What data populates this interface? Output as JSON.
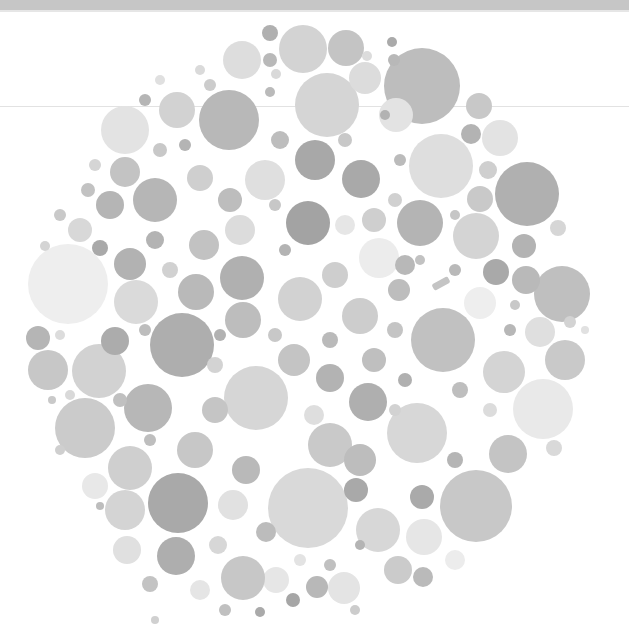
{
  "image": {
    "description": "Grayscale color-vision test plate made of packed dots",
    "width": 629,
    "height": 634
  },
  "colors": {
    "background": "#ffffff",
    "top_bar": "#c6c6c6",
    "fold_line": "#e2e2e2"
  },
  "dots": [
    {
      "cx": 422,
      "cy": 86,
      "r": 38,
      "fill": "#bdbdbd"
    },
    {
      "cx": 327,
      "cy": 105,
      "r": 32,
      "fill": "#d5d5d5"
    },
    {
      "cx": 229,
      "cy": 120,
      "r": 30,
      "fill": "#b8b8b8"
    },
    {
      "cx": 125,
      "cy": 130,
      "r": 24,
      "fill": "#e3e3e3"
    },
    {
      "cx": 303,
      "cy": 49,
      "r": 24,
      "fill": "#d3d3d3"
    },
    {
      "cx": 242,
      "cy": 60,
      "r": 19,
      "fill": "#dddddd"
    },
    {
      "cx": 346,
      "cy": 48,
      "r": 18,
      "fill": "#c4c4c4"
    },
    {
      "cx": 365,
      "cy": 78,
      "r": 16,
      "fill": "#dcdcdc"
    },
    {
      "cx": 177,
      "cy": 110,
      "r": 18,
      "fill": "#d2d2d2"
    },
    {
      "cx": 270,
      "cy": 33,
      "r": 8,
      "fill": "#b0b0b0"
    },
    {
      "cx": 270,
      "cy": 60,
      "r": 7,
      "fill": "#b9b9b9"
    },
    {
      "cx": 392,
      "cy": 42,
      "r": 5,
      "fill": "#aaaaaa"
    },
    {
      "cx": 394,
      "cy": 60,
      "r": 6,
      "fill": "#b8b8b8"
    },
    {
      "cx": 479,
      "cy": 106,
      "r": 13,
      "fill": "#c8c8c8"
    },
    {
      "cx": 441,
      "cy": 166,
      "r": 32,
      "fill": "#dedede"
    },
    {
      "cx": 527,
      "cy": 194,
      "r": 32,
      "fill": "#b0b0b0"
    },
    {
      "cx": 471,
      "cy": 134,
      "r": 10,
      "fill": "#b3b3b3"
    },
    {
      "cx": 500,
      "cy": 138,
      "r": 18,
      "fill": "#e3e3e3"
    },
    {
      "cx": 488,
      "cy": 170,
      "r": 9,
      "fill": "#cfcfcf"
    },
    {
      "cx": 480,
      "cy": 199,
      "r": 13,
      "fill": "#c9c9c9"
    },
    {
      "cx": 476,
      "cy": 236,
      "r": 23,
      "fill": "#d4d4d4"
    },
    {
      "cx": 420,
      "cy": 223,
      "r": 23,
      "fill": "#b4b4b4"
    },
    {
      "cx": 524,
      "cy": 246,
      "r": 12,
      "fill": "#b3b3b3"
    },
    {
      "cx": 558,
      "cy": 228,
      "r": 8,
      "fill": "#d6d6d6"
    },
    {
      "cx": 562,
      "cy": 294,
      "r": 28,
      "fill": "#bfbfbf"
    },
    {
      "cx": 526,
      "cy": 280,
      "r": 14,
      "fill": "#b9b9b9"
    },
    {
      "cx": 496,
      "cy": 272,
      "r": 13,
      "fill": "#a9a9a9"
    },
    {
      "cx": 480,
      "cy": 303,
      "r": 16,
      "fill": "#eeeeee"
    },
    {
      "cx": 540,
      "cy": 332,
      "r": 15,
      "fill": "#dfdfdf"
    },
    {
      "cx": 565,
      "cy": 360,
      "r": 20,
      "fill": "#c9c9c9"
    },
    {
      "cx": 504,
      "cy": 372,
      "r": 21,
      "fill": "#d4d4d4"
    },
    {
      "cx": 443,
      "cy": 340,
      "r": 32,
      "fill": "#c1c1c1"
    },
    {
      "cx": 379,
      "cy": 258,
      "r": 20,
      "fill": "#ececec"
    },
    {
      "cx": 399,
      "cy": 290,
      "r": 11,
      "fill": "#bdbdbd"
    },
    {
      "cx": 543,
      "cy": 409,
      "r": 30,
      "fill": "#e9e9e9"
    },
    {
      "cx": 508,
      "cy": 454,
      "r": 19,
      "fill": "#c4c4c4"
    },
    {
      "cx": 554,
      "cy": 448,
      "r": 8,
      "fill": "#d9d9d9"
    },
    {
      "cx": 476,
      "cy": 506,
      "r": 36,
      "fill": "#c8c8c8"
    },
    {
      "cx": 417,
      "cy": 433,
      "r": 30,
      "fill": "#d7d7d7"
    },
    {
      "cx": 368,
      "cy": 402,
      "r": 19,
      "fill": "#afafaf"
    },
    {
      "cx": 422,
      "cy": 497,
      "r": 12,
      "fill": "#aaaaaa"
    },
    {
      "cx": 424,
      "cy": 537,
      "r": 18,
      "fill": "#e6e6e6"
    },
    {
      "cx": 378,
      "cy": 530,
      "r": 22,
      "fill": "#d7d7d7"
    },
    {
      "cx": 398,
      "cy": 570,
      "r": 14,
      "fill": "#cbcbcb"
    },
    {
      "cx": 455,
      "cy": 560,
      "r": 10,
      "fill": "#ececec"
    },
    {
      "cx": 423,
      "cy": 577,
      "r": 10,
      "fill": "#bababa"
    },
    {
      "cx": 308,
      "cy": 508,
      "r": 40,
      "fill": "#d9d9d9"
    },
    {
      "cx": 344,
      "cy": 588,
      "r": 16,
      "fill": "#e4e4e4"
    },
    {
      "cx": 317,
      "cy": 587,
      "r": 11,
      "fill": "#b8b8b8"
    },
    {
      "cx": 276,
      "cy": 580,
      "r": 13,
      "fill": "#e6e6e6"
    },
    {
      "cx": 293,
      "cy": 600,
      "r": 7,
      "fill": "#a6a6a6"
    },
    {
      "cx": 243,
      "cy": 578,
      "r": 22,
      "fill": "#c7c7c7"
    },
    {
      "cx": 178,
      "cy": 503,
      "r": 30,
      "fill": "#a9a9a9"
    },
    {
      "cx": 176,
      "cy": 556,
      "r": 19,
      "fill": "#aeaeae"
    },
    {
      "cx": 125,
      "cy": 510,
      "r": 20,
      "fill": "#d4d4d4"
    },
    {
      "cx": 127,
      "cy": 550,
      "r": 14,
      "fill": "#e0e0e0"
    },
    {
      "cx": 85,
      "cy": 428,
      "r": 30,
      "fill": "#cbcbcb"
    },
    {
      "cx": 130,
      "cy": 468,
      "r": 22,
      "fill": "#cfcfcf"
    },
    {
      "cx": 95,
      "cy": 486,
      "r": 13,
      "fill": "#e8e8e8"
    },
    {
      "cx": 100,
      "cy": 506,
      "r": 4,
      "fill": "#bdbdbd"
    },
    {
      "cx": 148,
      "cy": 408,
      "r": 24,
      "fill": "#b7b7b7"
    },
    {
      "cx": 48,
      "cy": 370,
      "r": 20,
      "fill": "#c7c7c7"
    },
    {
      "cx": 52,
      "cy": 400,
      "r": 4,
      "fill": "#c9c9c9"
    },
    {
      "cx": 99,
      "cy": 371,
      "r": 27,
      "fill": "#d2d2d2"
    },
    {
      "cx": 38,
      "cy": 338,
      "r": 12,
      "fill": "#b5b5b5"
    },
    {
      "cx": 68,
      "cy": 284,
      "r": 40,
      "fill": "#eeeeee"
    },
    {
      "cx": 136,
      "cy": 302,
      "r": 22,
      "fill": "#dadada"
    },
    {
      "cx": 115,
      "cy": 341,
      "r": 14,
      "fill": "#acacac"
    },
    {
      "cx": 182,
      "cy": 345,
      "r": 32,
      "fill": "#aeaeae"
    },
    {
      "cx": 130,
      "cy": 264,
      "r": 16,
      "fill": "#b2b2b2"
    },
    {
      "cx": 196,
      "cy": 292,
      "r": 18,
      "fill": "#b9b9b9"
    },
    {
      "cx": 155,
      "cy": 200,
      "r": 22,
      "fill": "#b6b6b6"
    },
    {
      "cx": 110,
      "cy": 205,
      "r": 14,
      "fill": "#b5b5b5"
    },
    {
      "cx": 80,
      "cy": 230,
      "r": 12,
      "fill": "#d8d8d8"
    },
    {
      "cx": 125,
      "cy": 172,
      "r": 15,
      "fill": "#c3c3c3"
    },
    {
      "cx": 204,
      "cy": 245,
      "r": 15,
      "fill": "#c2c2c2"
    },
    {
      "cx": 242,
      "cy": 278,
      "r": 22,
      "fill": "#b0b0b0"
    },
    {
      "cx": 240,
      "cy": 230,
      "r": 15,
      "fill": "#dcdcdc"
    },
    {
      "cx": 230,
      "cy": 200,
      "r": 12,
      "fill": "#bdbdbd"
    },
    {
      "cx": 200,
      "cy": 178,
      "r": 13,
      "fill": "#cfcfcf"
    },
    {
      "cx": 265,
      "cy": 180,
      "r": 20,
      "fill": "#dfdfdf"
    },
    {
      "cx": 308,
      "cy": 223,
      "r": 22,
      "fill": "#a3a3a3"
    },
    {
      "cx": 315,
      "cy": 160,
      "r": 20,
      "fill": "#a8a8a8"
    },
    {
      "cx": 361,
      "cy": 179,
      "r": 19,
      "fill": "#a9a9a9"
    },
    {
      "cx": 396,
      "cy": 115,
      "r": 17,
      "fill": "#e3e3e3"
    },
    {
      "cx": 345,
      "cy": 225,
      "r": 10,
      "fill": "#e6e6e6"
    },
    {
      "cx": 374,
      "cy": 220,
      "r": 12,
      "fill": "#cfcfcf"
    },
    {
      "cx": 300,
      "cy": 299,
      "r": 22,
      "fill": "#d2d2d2"
    },
    {
      "cx": 360,
      "cy": 316,
      "r": 18,
      "fill": "#cdcdcd"
    },
    {
      "cx": 335,
      "cy": 275,
      "r": 13,
      "fill": "#cecece"
    },
    {
      "cx": 405,
      "cy": 265,
      "r": 10,
      "fill": "#b8b8b8"
    },
    {
      "cx": 256,
      "cy": 398,
      "r": 32,
      "fill": "#d6d6d6"
    },
    {
      "cx": 243,
      "cy": 320,
      "r": 18,
      "fill": "#bdbdbd"
    },
    {
      "cx": 215,
      "cy": 410,
      "r": 13,
      "fill": "#c5c5c5"
    },
    {
      "cx": 195,
      "cy": 450,
      "r": 18,
      "fill": "#c7c7c7"
    },
    {
      "cx": 246,
      "cy": 470,
      "r": 14,
      "fill": "#b9b9b9"
    },
    {
      "cx": 330,
      "cy": 445,
      "r": 22,
      "fill": "#c9c9c9"
    },
    {
      "cx": 360,
      "cy": 460,
      "r": 16,
      "fill": "#bdbdbd"
    },
    {
      "cx": 330,
      "cy": 378,
      "r": 14,
      "fill": "#b3b3b3"
    },
    {
      "cx": 294,
      "cy": 360,
      "r": 16,
      "fill": "#c4c4c4"
    },
    {
      "cx": 374,
      "cy": 360,
      "r": 12,
      "fill": "#bfbfbf"
    },
    {
      "cx": 314,
      "cy": 415,
      "r": 10,
      "fill": "#dedede"
    },
    {
      "cx": 233,
      "cy": 505,
      "r": 15,
      "fill": "#e1e1e1"
    },
    {
      "cx": 266,
      "cy": 532,
      "r": 10,
      "fill": "#bcbcbc"
    },
    {
      "cx": 356,
      "cy": 490,
      "r": 12,
      "fill": "#a9a9a9"
    },
    {
      "cx": 218,
      "cy": 545,
      "r": 9,
      "fill": "#d7d7d7"
    },
    {
      "cx": 150,
      "cy": 584,
      "r": 8,
      "fill": "#c3c3c3"
    },
    {
      "cx": 200,
      "cy": 590,
      "r": 10,
      "fill": "#e5e5e5"
    },
    {
      "cx": 225,
      "cy": 610,
      "r": 6,
      "fill": "#c0c0c0"
    },
    {
      "cx": 260,
      "cy": 612,
      "r": 5,
      "fill": "#aaaaaa"
    },
    {
      "cx": 160,
      "cy": 150,
      "r": 7,
      "fill": "#c8c8c8"
    },
    {
      "cx": 185,
      "cy": 145,
      "r": 6,
      "fill": "#b4b4b4"
    },
    {
      "cx": 95,
      "cy": 165,
      "r": 6,
      "fill": "#d5d5d5"
    },
    {
      "cx": 88,
      "cy": 190,
      "r": 7,
      "fill": "#c2c2c2"
    },
    {
      "cx": 60,
      "cy": 215,
      "r": 6,
      "fill": "#c9c9c9"
    },
    {
      "cx": 45,
      "cy": 246,
      "r": 5,
      "fill": "#d4d4d4"
    },
    {
      "cx": 100,
      "cy": 248,
      "r": 8,
      "fill": "#a9a9a9"
    },
    {
      "cx": 155,
      "cy": 240,
      "r": 9,
      "fill": "#b3b3b3"
    },
    {
      "cx": 170,
      "cy": 270,
      "r": 8,
      "fill": "#d1d1d1"
    },
    {
      "cx": 145,
      "cy": 330,
      "r": 6,
      "fill": "#bdbdbd"
    },
    {
      "cx": 60,
      "cy": 335,
      "r": 5,
      "fill": "#dcdcdc"
    },
    {
      "cx": 70,
      "cy": 395,
      "r": 5,
      "fill": "#d9d9d9"
    },
    {
      "cx": 120,
      "cy": 400,
      "r": 7,
      "fill": "#c0c0c0"
    },
    {
      "cx": 215,
      "cy": 365,
      "r": 8,
      "fill": "#d3d3d3"
    },
    {
      "cx": 220,
      "cy": 335,
      "r": 6,
      "fill": "#b2b2b2"
    },
    {
      "cx": 275,
      "cy": 335,
      "r": 7,
      "fill": "#c8c8c8"
    },
    {
      "cx": 330,
      "cy": 340,
      "r": 8,
      "fill": "#bababa"
    },
    {
      "cx": 395,
      "cy": 330,
      "r": 8,
      "fill": "#c4c4c4"
    },
    {
      "cx": 405,
      "cy": 380,
      "r": 7,
      "fill": "#b0b0b0"
    },
    {
      "cx": 395,
      "cy": 410,
      "r": 6,
      "fill": "#d2d2d2"
    },
    {
      "cx": 460,
      "cy": 390,
      "r": 8,
      "fill": "#bebebe"
    },
    {
      "cx": 490,
      "cy": 410,
      "r": 7,
      "fill": "#dcdcdc"
    },
    {
      "cx": 455,
      "cy": 460,
      "r": 8,
      "fill": "#b5b5b5"
    },
    {
      "cx": 510,
      "cy": 330,
      "r": 6,
      "fill": "#b7b7b7"
    },
    {
      "cx": 515,
      "cy": 305,
      "r": 5,
      "fill": "#c8c8c8"
    },
    {
      "cx": 455,
      "cy": 270,
      "r": 6,
      "fill": "#b9b9b9"
    },
    {
      "cx": 420,
      "cy": 260,
      "r": 5,
      "fill": "#c2c2c2"
    },
    {
      "cx": 455,
      "cy": 215,
      "r": 5,
      "fill": "#c6c6c6"
    },
    {
      "cx": 400,
      "cy": 160,
      "r": 6,
      "fill": "#bbbbbb"
    },
    {
      "cx": 395,
      "cy": 200,
      "r": 7,
      "fill": "#d0d0d0"
    },
    {
      "cx": 345,
      "cy": 140,
      "r": 7,
      "fill": "#c8c8c8"
    },
    {
      "cx": 280,
      "cy": 140,
      "r": 9,
      "fill": "#bdbdbd"
    },
    {
      "cx": 270,
      "cy": 92,
      "r": 5,
      "fill": "#bababa"
    },
    {
      "cx": 210,
      "cy": 85,
      "r": 6,
      "fill": "#cccccc"
    },
    {
      "cx": 200,
      "cy": 70,
      "r": 5,
      "fill": "#dadada"
    },
    {
      "cx": 160,
      "cy": 80,
      "r": 5,
      "fill": "#e0e0e0"
    },
    {
      "cx": 145,
      "cy": 100,
      "r": 6,
      "fill": "#b5b5b5"
    },
    {
      "cx": 367,
      "cy": 56,
      "r": 5,
      "fill": "#dcdcdc"
    },
    {
      "cx": 385,
      "cy": 115,
      "r": 5,
      "fill": "#b2b2b2"
    },
    {
      "cx": 276,
      "cy": 74,
      "r": 5,
      "fill": "#d9d9d9"
    },
    {
      "cx": 285,
      "cy": 250,
      "r": 6,
      "fill": "#b3b3b3"
    },
    {
      "cx": 275,
      "cy": 205,
      "r": 6,
      "fill": "#c7c7c7"
    },
    {
      "cx": 60,
      "cy": 450,
      "r": 5,
      "fill": "#cfcfcf"
    },
    {
      "cx": 150,
      "cy": 440,
      "r": 6,
      "fill": "#bebebe"
    },
    {
      "cx": 155,
      "cy": 620,
      "r": 4,
      "fill": "#d0d0d0"
    },
    {
      "cx": 330,
      "cy": 565,
      "r": 6,
      "fill": "#c0c0c0"
    },
    {
      "cx": 300,
      "cy": 560,
      "r": 6,
      "fill": "#e3e3e3"
    },
    {
      "cx": 360,
      "cy": 545,
      "r": 5,
      "fill": "#b4b4b4"
    },
    {
      "cx": 355,
      "cy": 610,
      "r": 5,
      "fill": "#cccccc"
    },
    {
      "cx": 570,
      "cy": 322,
      "r": 6,
      "fill": "#d3d3d3"
    },
    {
      "cx": 585,
      "cy": 330,
      "r": 4,
      "fill": "#e1e1e1"
    }
  ],
  "mark": {
    "x": 432,
    "y": 280,
    "w": 18,
    "h": 7,
    "rotate": -28,
    "fill": "#c4c4c4"
  }
}
